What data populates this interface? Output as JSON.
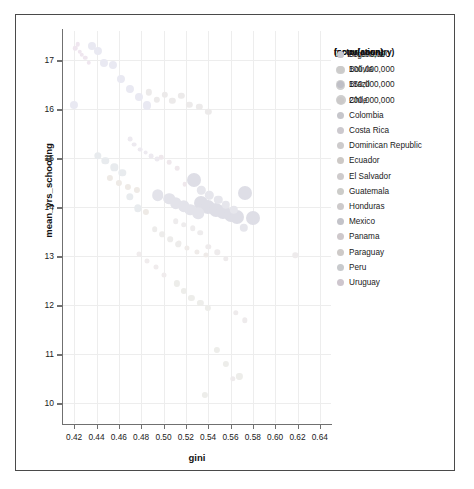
{
  "chart_data": {
    "type": "scatter",
    "title": "",
    "xlabel": "gini",
    "ylabel": "mean_yrs_schooling",
    "xlim": [
      0.41,
      0.65
    ],
    "ylim": [
      9.6,
      17.6
    ],
    "xticks": [
      "0.42",
      "0.44",
      "0.46",
      "0.48",
      "0.50",
      "0.52",
      "0.54",
      "0.56",
      "0.58",
      "0.60",
      "0.62",
      "0.64"
    ],
    "xtick_values": [
      0.42,
      0.44,
      0.46,
      0.48,
      0.5,
      0.52,
      0.54,
      0.56,
      0.58,
      0.6,
      0.62,
      0.64
    ],
    "yticks": [
      "10",
      "11",
      "12",
      "13",
      "14",
      "15",
      "16",
      "17"
    ],
    "ytick_values": [
      10,
      11,
      12,
      13,
      14,
      15,
      16,
      17
    ],
    "grid": true,
    "legend_position": "right",
    "size_encoding": "population",
    "color_encoding": "factor(country)",
    "points": [
      {
        "country": "Uruguay",
        "gini": 0.421,
        "mean_yrs_schooling": 17.25,
        "population": 3500000,
        "color": "#efe6ef"
      },
      {
        "country": "Uruguay",
        "gini": 0.423,
        "mean_yrs_schooling": 17.33,
        "population": 3500000,
        "color": "#efe6ef"
      },
      {
        "country": "Uruguay",
        "gini": 0.425,
        "mean_yrs_schooling": 17.18,
        "population": 3500000,
        "color": "#efe6ef"
      },
      {
        "country": "Uruguay",
        "gini": 0.427,
        "mean_yrs_schooling": 17.12,
        "population": 3500000,
        "color": "#efe6ef"
      },
      {
        "country": "Uruguay",
        "gini": 0.43,
        "mean_yrs_schooling": 17.05,
        "population": 3500000,
        "color": "#efe6ef"
      },
      {
        "country": "Argentina",
        "gini": 0.436,
        "mean_yrs_schooling": 17.3,
        "population": 44000000,
        "color": "#e9e9f2"
      },
      {
        "country": "Argentina",
        "gini": 0.441,
        "mean_yrs_schooling": 17.2,
        "population": 44000000,
        "color": "#e9e9f2"
      },
      {
        "country": "Argentina",
        "gini": 0.447,
        "mean_yrs_schooling": 16.95,
        "population": 44000000,
        "color": "#e9e9f2"
      },
      {
        "country": "Argentina",
        "gini": 0.455,
        "mean_yrs_schooling": 16.9,
        "population": 44000000,
        "color": "#e9e9f2"
      },
      {
        "country": "Argentina",
        "gini": 0.462,
        "mean_yrs_schooling": 16.62,
        "population": 44000000,
        "color": "#e9e9f2"
      },
      {
        "country": "Argentina",
        "gini": 0.47,
        "mean_yrs_schooling": 16.42,
        "population": 44000000,
        "color": "#e9e9f2"
      },
      {
        "country": "Argentina",
        "gini": 0.478,
        "mean_yrs_schooling": 16.25,
        "population": 44000000,
        "color": "#e9e9f2"
      },
      {
        "country": "Argentina",
        "gini": 0.42,
        "mean_yrs_schooling": 16.1,
        "population": 44000000,
        "color": "#e9e9f2"
      },
      {
        "country": "Chile",
        "gini": 0.487,
        "mean_yrs_schooling": 16.35,
        "population": 19000000,
        "color": "#eceaea"
      },
      {
        "country": "Chile",
        "gini": 0.494,
        "mean_yrs_schooling": 16.2,
        "population": 19000000,
        "color": "#eceaea"
      },
      {
        "country": "Chile",
        "gini": 0.501,
        "mean_yrs_schooling": 16.3,
        "population": 19000000,
        "color": "#eceaea"
      },
      {
        "country": "Chile",
        "gini": 0.508,
        "mean_yrs_schooling": 16.18,
        "population": 19000000,
        "color": "#eceaea"
      },
      {
        "country": "Chile",
        "gini": 0.516,
        "mean_yrs_schooling": 16.28,
        "population": 19000000,
        "color": "#eceaea"
      },
      {
        "country": "Chile",
        "gini": 0.523,
        "mean_yrs_schooling": 16.1,
        "population": 19000000,
        "color": "#eceaea"
      },
      {
        "country": "Chile",
        "gini": 0.532,
        "mean_yrs_schooling": 16.05,
        "population": 19000000,
        "color": "#eceaea"
      },
      {
        "country": "Costa Rica",
        "gini": 0.47,
        "mean_yrs_schooling": 15.4,
        "population": 5000000,
        "color": "#edeaf0"
      },
      {
        "country": "Costa Rica",
        "gini": 0.474,
        "mean_yrs_schooling": 15.28,
        "population": 5000000,
        "color": "#edeaf0"
      },
      {
        "country": "Costa Rica",
        "gini": 0.479,
        "mean_yrs_schooling": 15.18,
        "population": 5000000,
        "color": "#edeaf0"
      },
      {
        "country": "Costa Rica",
        "gini": 0.484,
        "mean_yrs_schooling": 15.12,
        "population": 5000000,
        "color": "#edeaf0"
      },
      {
        "country": "Costa Rica",
        "gini": 0.489,
        "mean_yrs_schooling": 15.05,
        "population": 5000000,
        "color": "#edeaf0"
      },
      {
        "country": "Panama",
        "gini": 0.498,
        "mean_yrs_schooling": 15.02,
        "population": 4200000,
        "color": "#efe8ec"
      },
      {
        "country": "Panama",
        "gini": 0.505,
        "mean_yrs_schooling": 14.92,
        "population": 4200000,
        "color": "#efe8ec"
      },
      {
        "country": "Panama",
        "gini": 0.512,
        "mean_yrs_schooling": 14.8,
        "population": 4200000,
        "color": "#efe8ec"
      },
      {
        "country": "Peru",
        "gini": 0.441,
        "mean_yrs_schooling": 15.05,
        "population": 32000000,
        "color": "#e8ebee"
      },
      {
        "country": "Peru",
        "gini": 0.448,
        "mean_yrs_schooling": 14.95,
        "population": 32000000,
        "color": "#e8ebee"
      },
      {
        "country": "Peru",
        "gini": 0.456,
        "mean_yrs_schooling": 14.82,
        "population": 32000000,
        "color": "#e8ebee"
      },
      {
        "country": "Peru",
        "gini": 0.463,
        "mean_yrs_schooling": 14.7,
        "population": 32000000,
        "color": "#e8ebee"
      },
      {
        "country": "Ecuador",
        "gini": 0.452,
        "mean_yrs_schooling": 14.6,
        "population": 17000000,
        "color": "#eeeae6"
      },
      {
        "country": "Ecuador",
        "gini": 0.46,
        "mean_yrs_schooling": 14.5,
        "population": 17000000,
        "color": "#eeeae6"
      },
      {
        "country": "Ecuador",
        "gini": 0.468,
        "mean_yrs_schooling": 14.42,
        "population": 17000000,
        "color": "#eeeae6"
      },
      {
        "country": "Ecuador",
        "gini": 0.476,
        "mean_yrs_schooling": 14.35,
        "population": 17000000,
        "color": "#eeeae6"
      },
      {
        "country": "Brazil",
        "gini": 0.527,
        "mean_yrs_schooling": 14.55,
        "population": 210000000,
        "color": "#dedee6"
      },
      {
        "country": "Brazil",
        "gini": 0.534,
        "mean_yrs_schooling": 14.1,
        "population": 210000000,
        "color": "#dedee6"
      },
      {
        "country": "Brazil",
        "gini": 0.54,
        "mean_yrs_schooling": 14.0,
        "population": 210000000,
        "color": "#dedee6"
      },
      {
        "country": "Brazil",
        "gini": 0.547,
        "mean_yrs_schooling": 13.95,
        "population": 210000000,
        "color": "#dedee6"
      },
      {
        "country": "Brazil",
        "gini": 0.553,
        "mean_yrs_schooling": 13.9,
        "population": 210000000,
        "color": "#dedee6"
      },
      {
        "country": "Brazil",
        "gini": 0.56,
        "mean_yrs_schooling": 13.85,
        "population": 210000000,
        "color": "#dedee6"
      },
      {
        "country": "Brazil",
        "gini": 0.566,
        "mean_yrs_schooling": 13.8,
        "population": 210000000,
        "color": "#dedee6"
      },
      {
        "country": "Mexico",
        "gini": 0.505,
        "mean_yrs_schooling": 14.18,
        "population": 126000000,
        "color": "#e3e3ea"
      },
      {
        "country": "Mexico",
        "gini": 0.511,
        "mean_yrs_schooling": 14.08,
        "population": 126000000,
        "color": "#e3e3ea"
      },
      {
        "country": "Mexico",
        "gini": 0.518,
        "mean_yrs_schooling": 14.02,
        "population": 126000000,
        "color": "#e3e3ea"
      },
      {
        "country": "Mexico",
        "gini": 0.524,
        "mean_yrs_schooling": 13.95,
        "population": 126000000,
        "color": "#e3e3ea"
      },
      {
        "country": "Mexico",
        "gini": 0.495,
        "mean_yrs_schooling": 14.25,
        "population": 126000000,
        "color": "#e3e3ea"
      },
      {
        "country": "Colombia",
        "gini": 0.534,
        "mean_yrs_schooling": 14.35,
        "population": 50000000,
        "color": "#e6e6ec"
      },
      {
        "country": "Colombia",
        "gini": 0.541,
        "mean_yrs_schooling": 14.25,
        "population": 50000000,
        "color": "#e6e6ec"
      },
      {
        "country": "Colombia",
        "gini": 0.549,
        "mean_yrs_schooling": 14.15,
        "population": 50000000,
        "color": "#e6e6ec"
      },
      {
        "country": "Colombia",
        "gini": 0.556,
        "mean_yrs_schooling": 14.05,
        "population": 50000000,
        "color": "#e6e6ec"
      },
      {
        "country": "Colombia",
        "gini": 0.563,
        "mean_yrs_schooling": 13.95,
        "population": 50000000,
        "color": "#e6e6ec"
      },
      {
        "country": "Dominican Republic",
        "gini": 0.511,
        "mean_yrs_schooling": 13.72,
        "population": 10800000,
        "color": "#eeeced"
      },
      {
        "country": "Dominican Republic",
        "gini": 0.518,
        "mean_yrs_schooling": 13.65,
        "population": 10800000,
        "color": "#eeeced"
      },
      {
        "country": "Dominican Republic",
        "gini": 0.526,
        "mean_yrs_schooling": 13.58,
        "population": 10800000,
        "color": "#eeeced"
      },
      {
        "country": "Bolivia",
        "gini": 0.492,
        "mean_yrs_schooling": 13.55,
        "population": 11500000,
        "color": "#edeceb"
      },
      {
        "country": "Bolivia",
        "gini": 0.499,
        "mean_yrs_schooling": 13.45,
        "population": 11500000,
        "color": "#edeceb"
      },
      {
        "country": "Bolivia",
        "gini": 0.506,
        "mean_yrs_schooling": 13.35,
        "population": 11500000,
        "color": "#edeceb"
      },
      {
        "country": "Paraguay",
        "gini": 0.514,
        "mean_yrs_schooling": 13.28,
        "population": 7000000,
        "color": "#efebe9"
      },
      {
        "country": "Paraguay",
        "gini": 0.521,
        "mean_yrs_schooling": 13.18,
        "population": 7000000,
        "color": "#efebe9"
      },
      {
        "country": "Paraguay",
        "gini": 0.53,
        "mean_yrs_schooling": 13.1,
        "population": 7000000,
        "color": "#efebe9"
      },
      {
        "country": "El Salvador",
        "gini": 0.478,
        "mean_yrs_schooling": 13.05,
        "population": 6400000,
        "color": "#f0eced"
      },
      {
        "country": "El Salvador",
        "gini": 0.485,
        "mean_yrs_schooling": 12.9,
        "population": 6400000,
        "color": "#f0eced"
      },
      {
        "country": "El Salvador",
        "gini": 0.493,
        "mean_yrs_schooling": 12.78,
        "population": 6400000,
        "color": "#f0eced"
      },
      {
        "country": "Honduras",
        "gini": 0.54,
        "mean_yrs_schooling": 13.2,
        "population": 9500000,
        "color": "#eeebec"
      },
      {
        "country": "Honduras",
        "gini": 0.548,
        "mean_yrs_schooling": 13.08,
        "population": 9500000,
        "color": "#eeebec"
      },
      {
        "country": "Honduras",
        "gini": 0.556,
        "mean_yrs_schooling": 12.95,
        "population": 9500000,
        "color": "#eeebec"
      },
      {
        "country": "Guatemala",
        "gini": 0.518,
        "mean_yrs_schooling": 12.3,
        "population": 17500000,
        "color": "#ededea"
      },
      {
        "country": "Guatemala",
        "gini": 0.525,
        "mean_yrs_schooling": 12.15,
        "population": 17500000,
        "color": "#ededea"
      },
      {
        "country": "Guatemala",
        "gini": 0.533,
        "mean_yrs_schooling": 12.05,
        "population": 17500000,
        "color": "#ededea"
      },
      {
        "country": "Guatemala",
        "gini": 0.512,
        "mean_yrs_schooling": 12.45,
        "population": 17500000,
        "color": "#ededea"
      },
      {
        "country": "Guatemala",
        "gini": 0.54,
        "mean_yrs_schooling": 11.95,
        "population": 17500000,
        "color": "#ededea"
      },
      {
        "country": "Honduras",
        "gini": 0.565,
        "mean_yrs_schooling": 11.85,
        "population": 9500000,
        "color": "#eeebec"
      },
      {
        "country": "Honduras",
        "gini": 0.573,
        "mean_yrs_schooling": 11.7,
        "population": 9500000,
        "color": "#eeebec"
      },
      {
        "country": "Guatemala",
        "gini": 0.548,
        "mean_yrs_schooling": 11.1,
        "population": 17500000,
        "color": "#ededea"
      },
      {
        "country": "Guatemala",
        "gini": 0.556,
        "mean_yrs_schooling": 10.8,
        "population": 17500000,
        "color": "#ededea"
      },
      {
        "country": "Honduras",
        "gini": 0.562,
        "mean_yrs_schooling": 10.5,
        "population": 9500000,
        "color": "#eeebec"
      },
      {
        "country": "Guatemala",
        "gini": 0.537,
        "mean_yrs_schooling": 10.18,
        "population": 17500000,
        "color": "#ededea"
      },
      {
        "country": "Guatemala",
        "gini": 0.568,
        "mean_yrs_schooling": 10.55,
        "population": 17500000,
        "color": "#ededea"
      },
      {
        "country": "Honduras",
        "gini": 0.618,
        "mean_yrs_schooling": 13.02,
        "population": 9500000,
        "color": "#eeebec"
      },
      {
        "country": "Brazil",
        "gini": 0.58,
        "mean_yrs_schooling": 13.78,
        "population": 210000000,
        "color": "#dedee6"
      },
      {
        "country": "Brazil",
        "gini": 0.573,
        "mean_yrs_schooling": 14.3,
        "population": 210000000,
        "color": "#dedee6"
      },
      {
        "country": "Colombia",
        "gini": 0.572,
        "mean_yrs_schooling": 13.58,
        "population": 50000000,
        "color": "#e6e6ec"
      },
      {
        "country": "Peru",
        "gini": 0.47,
        "mean_yrs_schooling": 14.22,
        "population": 32000000,
        "color": "#e8ebee"
      },
      {
        "country": "Peru",
        "gini": 0.477,
        "mean_yrs_schooling": 13.98,
        "population": 32000000,
        "color": "#e8ebee"
      },
      {
        "country": "Ecuador",
        "gini": 0.484,
        "mean_yrs_schooling": 13.9,
        "population": 17000000,
        "color": "#eeeae6"
      },
      {
        "country": "Panama",
        "gini": 0.519,
        "mean_yrs_schooling": 14.48,
        "population": 4200000,
        "color": "#efe8ec"
      },
      {
        "country": "Costa Rica",
        "gini": 0.494,
        "mean_yrs_schooling": 14.98,
        "population": 5000000,
        "color": "#edeaf0"
      },
      {
        "country": "Uruguay",
        "gini": 0.433,
        "mean_yrs_schooling": 16.95,
        "population": 3500000,
        "color": "#efe6ef"
      },
      {
        "country": "Mexico",
        "gini": 0.531,
        "mean_yrs_schooling": 13.88,
        "population": 126000000,
        "color": "#e3e3ea"
      },
      {
        "country": "Bolivia",
        "gini": 0.513,
        "mean_yrs_schooling": 13.25,
        "population": 11500000,
        "color": "#edeceb"
      },
      {
        "country": "Paraguay",
        "gini": 0.538,
        "mean_yrs_schooling": 13.02,
        "population": 7000000,
        "color": "#efebe9"
      },
      {
        "country": "El Salvador",
        "gini": 0.5,
        "mean_yrs_schooling": 12.62,
        "population": 6400000,
        "color": "#f0eced"
      },
      {
        "country": "Dominican Republic",
        "gini": 0.533,
        "mean_yrs_schooling": 13.48,
        "population": 10800000,
        "color": "#eeeced"
      },
      {
        "country": "Chile",
        "gini": 0.54,
        "mean_yrs_schooling": 15.95,
        "population": 19000000,
        "color": "#eceaea"
      },
      {
        "country": "Argentina",
        "gini": 0.485,
        "mean_yrs_schooling": 16.08,
        "population": 44000000,
        "color": "#e9e9f2"
      }
    ]
  },
  "legends": {
    "size_legend": {
      "title": "(population)",
      "items": [
        {
          "label": "50,000,000",
          "value": 50000000
        },
        {
          "label": "100,000,000",
          "value": 100000000
        },
        {
          "label": "150,000,000",
          "value": 150000000
        },
        {
          "label": "200,000,000",
          "value": 200000000
        }
      ]
    },
    "color_legend": {
      "title": "factor(country)",
      "items": [
        {
          "label": "Argentina",
          "color": "#e9e9f2"
        },
        {
          "label": "Bolivia",
          "color": "#edeceb"
        },
        {
          "label": "Brazil",
          "color": "#dedee6"
        },
        {
          "label": "Chile",
          "color": "#eceaea"
        },
        {
          "label": "Colombia",
          "color": "#e6e6ec"
        },
        {
          "label": "Costa Rica",
          "color": "#edeaf0"
        },
        {
          "label": "Dominican Republic",
          "color": "#eeeced"
        },
        {
          "label": "Ecuador",
          "color": "#eeeae6"
        },
        {
          "label": "El Salvador",
          "color": "#f0eced"
        },
        {
          "label": "Guatemala",
          "color": "#ededea"
        },
        {
          "label": "Honduras",
          "color": "#eeebec"
        },
        {
          "label": "Mexico",
          "color": "#e3e3ea"
        },
        {
          "label": "Panama",
          "color": "#efe8ec"
        },
        {
          "label": "Paraguay",
          "color": "#efebe9"
        },
        {
          "label": "Peru",
          "color": "#e8ebee"
        },
        {
          "label": "Uruguay",
          "color": "#efe6ef"
        }
      ]
    }
  }
}
